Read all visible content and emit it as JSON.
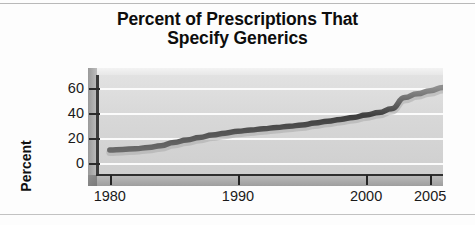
{
  "figure": {
    "title_line1": "Percent of Prescriptions That",
    "title_line2": "Specify Generics"
  },
  "chart_data": {
    "type": "area",
    "title": "Percent of Prescriptions That Specify Generics",
    "xlabel": "",
    "ylabel": "Percent",
    "xlim": [
      1979,
      2006
    ],
    "ylim": [
      -10,
      70
    ],
    "yticks": [
      0,
      20,
      40,
      60
    ],
    "ytick_labels": [
      "0",
      "20",
      "40",
      "60"
    ],
    "xticks": [
      1980,
      1990,
      2000,
      2005
    ],
    "xtick_labels": [
      "1980",
      "1990",
      "2000",
      "2005"
    ],
    "grid": "horizontal-white",
    "legend": "none",
    "style": "3d-ribbon",
    "series_name": "Percent of prescriptions specifying generics",
    "line_color": "#4a4a4a",
    "plot_background": "#d8d8d8",
    "gridline_color": "#fbfbfb",
    "x": [
      1980,
      1981,
      1982,
      1983,
      1984,
      1985,
      1986,
      1987,
      1988,
      1989,
      1990,
      1991,
      1992,
      1993,
      1994,
      1995,
      1996,
      1997,
      1998,
      1999,
      2000,
      2001,
      2002,
      2003,
      2004,
      2005,
      2006
    ],
    "values": [
      10,
      10.5,
      11,
      12,
      13.5,
      16,
      18,
      20,
      22,
      23.5,
      25,
      26,
      27,
      28,
      29,
      30,
      31.5,
      33,
      34.5,
      36,
      38,
      40,
      43,
      52,
      55,
      57.5,
      60
    ]
  }
}
